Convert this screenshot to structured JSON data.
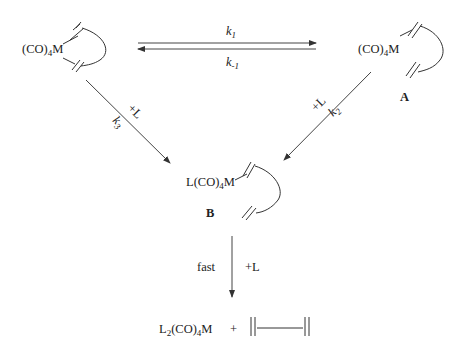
{
  "diagram": {
    "type": "reaction-scheme",
    "nodes": {
      "start": {
        "formula_prefix": "(CO)",
        "formula_sub": "4",
        "formula_suffix": "M",
        "label": ""
      },
      "A": {
        "formula_prefix": "(CO)",
        "formula_sub": "4",
        "formula_suffix": "M",
        "label": "A"
      },
      "B": {
        "formula_prefix": "L(CO)",
        "formula_sub": "4",
        "formula_suffix": "M",
        "label": "B"
      },
      "product": {
        "formula_prefix": "L",
        "formula_sub1": "2",
        "formula_mid": "(CO)",
        "formula_sub2": "4",
        "formula_suffix": "M",
        "plus": "+"
      }
    },
    "edges": {
      "forward": {
        "k": "k",
        "sub": "1"
      },
      "reverse": {
        "k": "k",
        "sub": "-1"
      },
      "k3": {
        "reagent": "+L",
        "k": "k",
        "sub": "3"
      },
      "k2": {
        "reagent": "+L",
        "k": "k",
        "sub": "2"
      },
      "final": {
        "left": "fast",
        "right": "+L"
      }
    }
  }
}
